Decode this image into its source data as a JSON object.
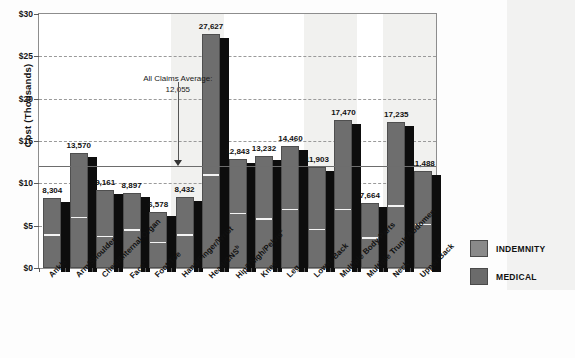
{
  "chart_data": {
    "type": "bar",
    "title": "",
    "subtitle": "",
    "xlabel": "",
    "ylabel": "Cost (Thousands)",
    "ylim": [
      0,
      30
    ],
    "yticks": [
      "$0",
      "$5",
      "$10",
      "$15",
      "$20",
      "$25",
      "$30"
    ],
    "ytick_values": [
      0,
      5,
      10,
      15,
      20,
      25,
      30
    ],
    "grid": true,
    "legend_position": "right",
    "categories": [
      "Ankle",
      "Arm/Shoulder",
      "Chest/Internal Organ",
      "Face",
      "Foot/Toe",
      "Hand/Finger/Wrist",
      "Head/CNS",
      "Hip/Thigh/Pelvis",
      "Knee",
      "Leg",
      "Lower Back",
      "Multiple Body Parts",
      "Multiple Trunk/Abdomen",
      "Neck",
      "Upper Back"
    ],
    "category_footnotes": [
      "",
      "",
      "",
      "a",
      "",
      "",
      "b",
      "c",
      "",
      "",
      "",
      "",
      "",
      "",
      ""
    ],
    "total_labels": [
      "8,304",
      "13,570",
      "9,161",
      "8,897",
      "6,578",
      "8,432",
      "27,627",
      "12,843",
      "13,232",
      "14,460",
      "11,903",
      "17,470",
      "7,664",
      "17,235",
      "11,488"
    ],
    "totals": [
      8304,
      13570,
      9161,
      8897,
      6578,
      8432,
      27627,
      12843,
      13232,
      14460,
      11903,
      17470,
      7664,
      17235,
      11488
    ],
    "series": [
      {
        "name": "INDEMNITY",
        "color": "#808080",
        "values": [
          3680,
          5740,
          3520,
          4280,
          2800,
          3700,
          10800,
          6250,
          5600,
          6700,
          4350,
          6700,
          3320,
          7100,
          4950
        ]
      },
      {
        "name": "MEDICAL",
        "color": "#6e6e6e",
        "values": [
          4624,
          7830,
          5641,
          4617,
          3778,
          4732,
          16827,
          6593,
          7632,
          7760,
          7553,
          10770,
          4344,
          10135,
          6538
        ]
      }
    ],
    "reference_line": {
      "label": "All Claims Average:",
      "value_label": "12,055",
      "value": 12055
    },
    "legend": [
      {
        "label": "INDEMNITY",
        "color": "#8a8a8a"
      },
      {
        "label": "MEDICAL",
        "color": "#6b6b6b"
      }
    ]
  }
}
